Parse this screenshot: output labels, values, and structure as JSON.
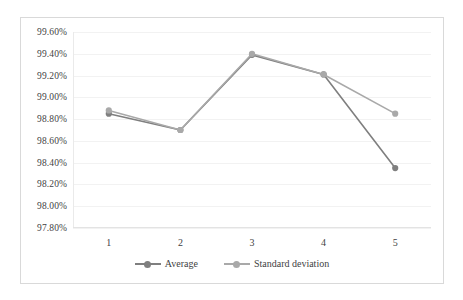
{
  "chart_data": {
    "type": "line",
    "title": "",
    "subtitle": "",
    "xlabel": "",
    "ylabel": "",
    "categories": [
      "1",
      "2",
      "3",
      "4",
      "5"
    ],
    "x": [
      1,
      2,
      3,
      4,
      5
    ],
    "ylim": [
      97.8,
      99.6
    ],
    "ytick_step": 0.2,
    "ytick_labels": [
      "99.60%",
      "99.40%",
      "99.20%",
      "99.00%",
      "98.80%",
      "98.60%",
      "98.40%",
      "98.20%",
      "98.00%",
      "97.80%"
    ],
    "ytick_values": [
      99.6,
      99.4,
      99.2,
      99.0,
      98.8,
      98.6,
      98.4,
      98.2,
      98.0,
      97.8
    ],
    "grid": true,
    "grid_axis": "y",
    "legend_position": "bottom",
    "value_suffix": "%",
    "series": [
      {
        "name": "Average",
        "color": "#7f7f7f",
        "marker": "circle",
        "values": [
          98.85,
          98.7,
          99.39,
          99.21,
          98.35
        ]
      },
      {
        "name": "Standard deviation",
        "color": "#a9a9a9",
        "marker": "circle",
        "values": [
          98.88,
          98.7,
          99.4,
          99.21,
          98.85
        ]
      }
    ]
  },
  "legend": {
    "entries": [
      {
        "label": "Average"
      },
      {
        "label": "Standard deviation"
      }
    ]
  },
  "colors": {
    "average": "#7f7f7f",
    "standard_deviation": "#a9a9a9",
    "gridline": "#f2f2f2",
    "axis": "#e3e3e3",
    "border": "#d9d9d9",
    "text": "#3f3f3f",
    "background": "#ffffff"
  }
}
